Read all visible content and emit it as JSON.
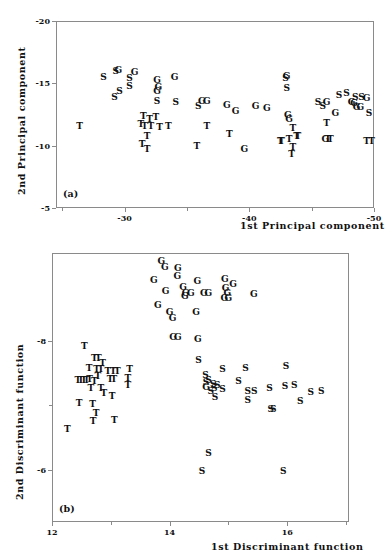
{
  "figure": {
    "panels": [
      {
        "tag": "(a)",
        "xaxis": {
          "title": "1st Principal component",
          "ticks": [
            -30,
            -40,
            -50
          ],
          "tick_labels": [
            "-30",
            "-40",
            "-50"
          ],
          "range": [
            -24.5,
            -50.0
          ],
          "minor_ticks": [
            -25,
            -35,
            -45
          ]
        },
        "yaxis": {
          "title": "2nd Principal component",
          "ticks": [
            -20,
            -15,
            -10,
            -5
          ],
          "tick_labels": [
            "-20",
            "-15",
            "-10",
            "-5"
          ],
          "range": [
            -20.0,
            -5.0
          ]
        },
        "chart_data": {
          "type": "scatter",
          "title": "",
          "xlabel": "1st Principal component",
          "ylabel": "2nd Principal component",
          "xlim": [
            -24.5,
            -50.0
          ],
          "ylim": [
            -20.0,
            -5.0
          ],
          "grid": false,
          "legend": "none",
          "marker_style": "text-letter",
          "series": [
            {
              "name": "S",
              "label": "S",
              "points": [
                [
                  -28.3,
                  -15.5
                ],
                [
                  -29.3,
                  -16.0
                ],
                [
                  -30.4,
                  -15.4
                ],
                [
                  -30.4,
                  -14.8
                ],
                [
                  -29.6,
                  -14.4
                ],
                [
                  -29.2,
                  -13.9
                ],
                [
                  -32.6,
                  -13.6
                ],
                [
                  -34.1,
                  -13.5
                ],
                [
                  -35.9,
                  -13.2
                ],
                [
                  -42.9,
                  -15.4
                ],
                [
                  -43.0,
                  -14.6
                ],
                [
                  -45.5,
                  -13.5
                ],
                [
                  -45.9,
                  -13.2
                ],
                [
                  -47.2,
                  -14.1
                ],
                [
                  -47.8,
                  -14.2
                ],
                [
                  -48.5,
                  -13.9
                ],
                [
                  -49.0,
                  -13.9
                ],
                [
                  -49.6,
                  -12.6
                ]
              ]
            },
            {
              "name": "G",
              "label": "G",
              "points": [
                [
                  -29.5,
                  -16.1
                ],
                [
                  -30.8,
                  -15.9
                ],
                [
                  -32.6,
                  -15.3
                ],
                [
                  -32.7,
                  -14.7
                ],
                [
                  -32.6,
                  -14.4
                ],
                [
                  -34.0,
                  -15.5
                ],
                [
                  -36.2,
                  -13.6
                ],
                [
                  -36.6,
                  -13.6
                ],
                [
                  -38.2,
                  -13.3
                ],
                [
                  -38.9,
                  -12.8
                ],
                [
                  -40.5,
                  -13.2
                ],
                [
                  -41.4,
                  -13.0
                ],
                [
                  -39.6,
                  -9.7
                ],
                [
                  -43.0,
                  -15.6
                ],
                [
                  -43.1,
                  -12.5
                ],
                [
                  -43.2,
                  -12.1
                ],
                [
                  -46.2,
                  -13.5
                ],
                [
                  -46.9,
                  -12.6
                ],
                [
                  -48.2,
                  -13.5
                ],
                [
                  -48.4,
                  -13.4
                ],
                [
                  -48.6,
                  -13.1
                ],
                [
                  -48.9,
                  -13.1
                ],
                [
                  -49.4,
                  -13.8
                ],
                [
                  -46.1,
                  -10.5
                ]
              ]
            },
            {
              "name": "T",
              "label": "T",
              "points": [
                [
                  -26.4,
                  -11.6
                ],
                [
                  -31.5,
                  -12.4
                ],
                [
                  -32.0,
                  -12.1
                ],
                [
                  -31.3,
                  -11.7
                ],
                [
                  -31.6,
                  -11.6
                ],
                [
                  -32.1,
                  -11.6
                ],
                [
                  -32.5,
                  -12.3
                ],
                [
                  -32.8,
                  -11.5
                ],
                [
                  -31.8,
                  -10.8
                ],
                [
                  -33.5,
                  -11.6
                ],
                [
                  -31.4,
                  -10.1
                ],
                [
                  -31.8,
                  -9.7
                ],
                [
                  -35.8,
                  -10.0
                ],
                [
                  -36.6,
                  -11.6
                ],
                [
                  -38.4,
                  -10.9
                ],
                [
                  -42.5,
                  -10.4
                ],
                [
                  -42.6,
                  -10.4
                ],
                [
                  -43.2,
                  -10.5
                ],
                [
                  -43.8,
                  -10.8
                ],
                [
                  -43.9,
                  -10.8
                ],
                [
                  -43.5,
                  -11.4
                ],
                [
                  -43.5,
                  -9.9
                ],
                [
                  -43.4,
                  -9.3
                ],
                [
                  -46.2,
                  -11.8
                ],
                [
                  -46.3,
                  -10.5
                ],
                [
                  -46.5,
                  -10.5
                ],
                [
                  -49.4,
                  -10.4
                ],
                [
                  -49.8,
                  -10.4
                ]
              ]
            }
          ]
        }
      },
      {
        "tag": "(b)",
        "xaxis": {
          "title": "1st Discriminant function",
          "ticks": [
            12,
            14,
            16
          ],
          "tick_labels": [
            "12",
            "14",
            "16"
          ],
          "range": [
            12.0,
            17.05
          ],
          "minor_ticks": [
            13,
            15,
            17
          ]
        },
        "yaxis": {
          "title": "2nd Discriminant function",
          "ticks": [
            -8,
            -6
          ],
          "tick_labels": [
            "-8",
            "-6"
          ],
          "range": [
            -9.35,
            -5.2
          ],
          "minor_ticks": [
            -7
          ]
        },
        "chart_data": {
          "type": "scatter",
          "title": "",
          "xlabel": "1st Discriminant function",
          "ylabel": "2nd Discriminant function",
          "xlim": [
            12.0,
            17.05
          ],
          "ylim": [
            -9.35,
            -5.2
          ],
          "grid": false,
          "legend": "none",
          "marker_style": "text-letter",
          "series": [
            {
              "name": "G",
              "label": "G",
              "points": [
                [
                  13.86,
                  -9.22
                ],
                [
                  13.92,
                  -9.13
                ],
                [
                  14.14,
                  -9.12
                ],
                [
                  14.13,
                  -9.0
                ],
                [
                  13.73,
                  -8.93
                ],
                [
                  14.23,
                  -8.83
                ],
                [
                  14.47,
                  -8.92
                ],
                [
                  14.94,
                  -8.95
                ],
                [
                  15.08,
                  -8.87
                ],
                [
                  14.95,
                  -8.81
                ],
                [
                  13.93,
                  -8.77
                ],
                [
                  14.27,
                  -8.74
                ],
                [
                  14.36,
                  -8.73
                ],
                [
                  14.58,
                  -8.73
                ],
                [
                  14.66,
                  -8.73
                ],
                [
                  14.98,
                  -8.74
                ],
                [
                  15.43,
                  -8.72
                ],
                [
                  14.26,
                  -8.68
                ],
                [
                  14.93,
                  -8.65
                ],
                [
                  15.0,
                  -8.65
                ],
                [
                  13.8,
                  -8.55
                ],
                [
                  14.0,
                  -8.44
                ],
                [
                  14.05,
                  -8.34
                ],
                [
                  14.45,
                  -8.44
                ],
                [
                  14.06,
                  -8.05
                ],
                [
                  14.14,
                  -8.05
                ],
                [
                  14.48,
                  -8.03
                ]
              ]
            },
            {
              "name": "T",
              "label": "T",
              "points": [
                [
                  12.55,
                  -7.91
                ],
                [
                  12.72,
                  -7.73
                ],
                [
                  12.79,
                  -7.73
                ],
                [
                  12.86,
                  -7.66
                ],
                [
                  12.63,
                  -7.58
                ],
                [
                  12.76,
                  -7.56
                ],
                [
                  12.83,
                  -7.56
                ],
                [
                  12.95,
                  -7.53
                ],
                [
                  13.04,
                  -7.53
                ],
                [
                  13.11,
                  -7.53
                ],
                [
                  13.32,
                  -7.56
                ],
                [
                  12.78,
                  -7.45
                ],
                [
                  12.44,
                  -7.39
                ],
                [
                  12.49,
                  -7.39
                ],
                [
                  12.54,
                  -7.39
                ],
                [
                  12.59,
                  -7.39
                ],
                [
                  12.64,
                  -7.41
                ],
                [
                  12.72,
                  -7.38
                ],
                [
                  12.99,
                  -7.4
                ],
                [
                  13.05,
                  -7.4
                ],
                [
                  13.29,
                  -7.42
                ],
                [
                  13.29,
                  -7.32
                ],
                [
                  12.66,
                  -7.26
                ],
                [
                  12.83,
                  -7.27
                ],
                [
                  12.88,
                  -7.19
                ],
                [
                  13.02,
                  -7.14
                ],
                [
                  12.46,
                  -7.03
                ],
                [
                  12.69,
                  -7.02
                ],
                [
                  12.75,
                  -6.88
                ],
                [
                  12.7,
                  -6.76
                ],
                [
                  13.06,
                  -6.77
                ],
                [
                  12.26,
                  -6.64
                ]
              ]
            },
            {
              "name": "S",
              "label": "S",
              "points": [
                [
                  14.49,
                  -7.7
                ],
                [
                  14.9,
                  -7.56
                ],
                [
                  15.29,
                  -7.57
                ],
                [
                  15.98,
                  -7.6
                ],
                [
                  14.61,
                  -7.47
                ],
                [
                  14.66,
                  -7.39
                ],
                [
                  14.62,
                  -7.36
                ],
                [
                  14.74,
                  -7.33
                ],
                [
                  14.76,
                  -7.27
                ],
                [
                  14.81,
                  -7.31
                ],
                [
                  15.17,
                  -7.38
                ],
                [
                  15.96,
                  -7.3
                ],
                [
                  16.12,
                  -7.31
                ],
                [
                  14.7,
                  -7.22
                ],
                [
                  14.9,
                  -7.25
                ],
                [
                  15.33,
                  -7.22
                ],
                [
                  15.44,
                  -7.22
                ],
                [
                  15.7,
                  -7.27
                ],
                [
                  16.4,
                  -7.21
                ],
                [
                  16.58,
                  -7.22
                ],
                [
                  14.77,
                  -7.13
                ],
                [
                  15.33,
                  -7.08
                ],
                [
                  16.22,
                  -7.07
                ],
                [
                  15.72,
                  -6.95
                ],
                [
                  15.76,
                  -6.95
                ],
                [
                  14.66,
                  -6.27
                ],
                [
                  14.55,
                  -5.98
                ],
                [
                  15.93,
                  -5.98
                ]
              ],
              "note_extra_marker": {
                "label": "G",
                "x": 14.62,
                "y": -7.29
              }
            }
          ]
        }
      }
    ]
  }
}
